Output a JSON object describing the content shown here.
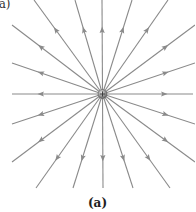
{
  "figure": {
    "corner_label": "(a)",
    "caption": "(a)",
    "charge": {
      "sign": "+",
      "cx": 102.5,
      "cy": 94,
      "r": 4.5,
      "color": "#8c8c8c"
    },
    "line_color": "#8a8a8a",
    "arrow_direction": "outward",
    "lines": [
      {
        "x": 102,
        "y": 0
      },
      {
        "x": 132,
        "y": 0
      },
      {
        "x": 168,
        "y": 0
      },
      {
        "x": 195,
        "y": 25
      },
      {
        "x": 195,
        "y": 63
      },
      {
        "x": 193,
        "y": 94
      },
      {
        "x": 195,
        "y": 124
      },
      {
        "x": 195,
        "y": 162
      },
      {
        "x": 170,
        "y": 188
      },
      {
        "x": 133,
        "y": 188
      },
      {
        "x": 103,
        "y": 188
      },
      {
        "x": 73,
        "y": 188
      },
      {
        "x": 36,
        "y": 188
      },
      {
        "x": 12,
        "y": 162
      },
      {
        "x": 12,
        "y": 124
      },
      {
        "x": 12,
        "y": 94
      },
      {
        "x": 12,
        "y": 63
      },
      {
        "x": 12,
        "y": 25
      },
      {
        "x": 34,
        "y": 0
      },
      {
        "x": 75,
        "y": 0
      }
    ]
  }
}
